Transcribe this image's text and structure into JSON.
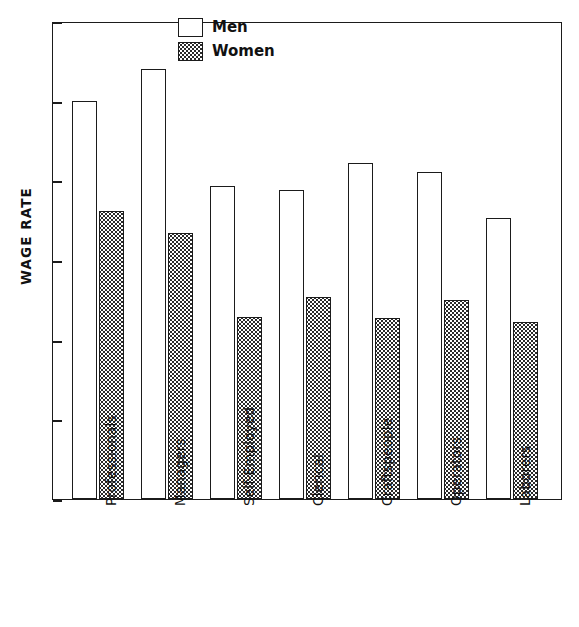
{
  "chart_data": {
    "type": "bar",
    "title": "",
    "xlabel": "",
    "ylabel": "WAGE RATE",
    "ylim": [
      0,
      6
    ],
    "yticks": [
      "0",
      "l",
      "2",
      "3",
      "4",
      "5",
      "6"
    ],
    "ytick_values": [
      0,
      1,
      2,
      3,
      4,
      5,
      6
    ],
    "grid": false,
    "legend_position": "top-center",
    "categories": [
      "Professionals",
      "Managers",
      "Self-Employed",
      "Clerical",
      "Craftspeople",
      "Operators",
      "Laborers"
    ],
    "series": [
      {
        "name": "Men",
        "fill": "white",
        "values": [
          5.0,
          5.4,
          3.93,
          3.88,
          4.22,
          4.1,
          3.53
        ]
      },
      {
        "name": "Women",
        "fill": "stippled",
        "values": [
          3.61,
          3.34,
          2.28,
          2.54,
          2.27,
          2.5,
          2.22
        ]
      }
    ]
  },
  "legend": {
    "entries": [
      {
        "label": "Men"
      },
      {
        "label": "Women"
      }
    ]
  },
  "colors": {
    "axis": "#1b1b1b",
    "background": "#ffffff",
    "men_fill": "#ffffff",
    "women_fill": "#2a2a2a"
  }
}
